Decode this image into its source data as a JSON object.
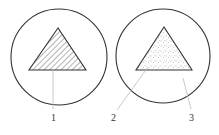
{
  "figure": {
    "left": {
      "label": "1",
      "fill": "hatched",
      "circle": {
        "cx": 59,
        "cy": 57,
        "r": 48
      },
      "triangle": {
        "apex": [
          58,
          28
        ],
        "base_left": [
          29,
          70
        ],
        "base_right": [
          86,
          70
        ]
      }
    },
    "right": {
      "labels": [
        "2",
        "3"
      ],
      "fill": "dotted",
      "circle": {
        "cx": 163,
        "cy": 56,
        "r": 47
      },
      "triangle": {
        "apex": [
          164,
          27
        ],
        "base_left": [
          136,
          70
        ],
        "base_right": [
          192,
          70
        ]
      }
    }
  },
  "colors": {
    "stroke": "#333333",
    "leader": "#bbbbbb",
    "background": "#ffffff"
  }
}
